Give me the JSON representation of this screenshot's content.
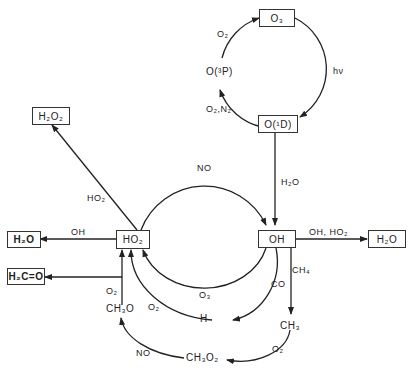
{
  "nodes": {
    "o3": "O₃",
    "o1d": "O(¹D)",
    "o3p": "O(³P)",
    "oh": "OH",
    "ho2": "HO₂",
    "h2o2": "H₂O₂",
    "h2o_left": "H₂O",
    "h2co": "H₂C=O",
    "h2o_right": "H₂O",
    "h": "H",
    "ch3": "CH₃",
    "ch3o": "CH₃O",
    "ch3o2": "CH₃O₂"
  },
  "edge_labels": {
    "o3_to_o1d": "hν",
    "o1d_to_o3p": "O₂,N₂",
    "o3p_to_o3": "O₂",
    "o1d_to_oh": "H₂O",
    "ho2_to_oh": "NO",
    "ho2_to_h2o2": "HO₂",
    "ho2_to_h2o": "OH",
    "oh_to_h2o": "OH, HO₂",
    "oh_to_ho2_o3": "O₃",
    "oh_to_h": "CO",
    "h_to_ho2": "O₂",
    "oh_to_ch3": "CH₄",
    "ch3_to_ch3o2": "O₂",
    "ch3o2_to_ch3o": "NO",
    "ch3o_to_ho2": "O₂"
  }
}
